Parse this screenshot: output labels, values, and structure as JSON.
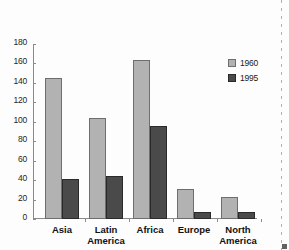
{
  "chart_data": {
    "type": "bar",
    "title": "",
    "subtitle": "",
    "xlabel": "",
    "ylabel": "",
    "categories": [
      "Asia",
      "Latin\nAmerica",
      "Africa",
      "Europe",
      "North\nAmerica"
    ],
    "series": [
      {
        "name": "1960",
        "color": "#b2b2b2",
        "values": [
          145,
          104,
          164,
          31,
          23
        ]
      },
      {
        "name": "1995",
        "color": "#4a4a4a",
        "values": [
          41,
          44,
          96,
          7,
          7
        ]
      }
    ],
    "ylim": [
      0,
      180
    ],
    "yticks": [
      0,
      20,
      40,
      60,
      80,
      100,
      120,
      140,
      160,
      180
    ],
    "ytick_labels": [
      "0",
      "20",
      "40",
      "60",
      "80",
      "100",
      "120",
      "140",
      "160",
      "180"
    ],
    "grid": false,
    "legend_position": "right-top",
    "legend_entries": [
      "1960",
      "1995"
    ],
    "annotations": []
  }
}
